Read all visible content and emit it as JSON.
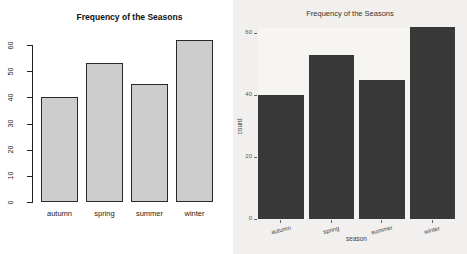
{
  "chart_data": [
    {
      "type": "bar",
      "renderer": "base-r-barplot",
      "title": "Frequency of the Seasons",
      "categories": [
        "autumn",
        "spring",
        "summer",
        "winter"
      ],
      "values": [
        40,
        53,
        45,
        62
      ],
      "xlabel": "",
      "ylabel": "",
      "ylim": [
        0,
        60
      ],
      "yticks": [
        0,
        10,
        20,
        30,
        40,
        50,
        60
      ],
      "grid": false,
      "legend": false,
      "bar_fill": "#cdcdcd",
      "bar_border": "#2a2a2a",
      "background": "#ffffff"
    },
    {
      "type": "bar",
      "renderer": "ggplot2",
      "title": "Frequency of the Seasons",
      "categories": [
        "autumn",
        "spring",
        "summer",
        "winter"
      ],
      "values": [
        40,
        53,
        45,
        62
      ],
      "xlabel": "season",
      "ylabel": "count",
      "ylim": [
        0,
        60
      ],
      "yticks": [
        0,
        20,
        40,
        60
      ],
      "grid": false,
      "legend": false,
      "bar_fill": "#383838",
      "bar_border": "",
      "background": "#f1f0ee"
    }
  ]
}
